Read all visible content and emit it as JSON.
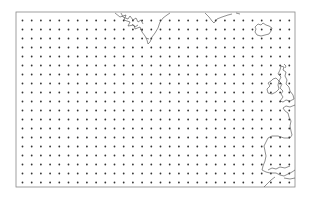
{
  "map": {
    "region": "North Atlantic",
    "frame": {
      "x": 16,
      "y": 12,
      "width": 279,
      "height": 175,
      "stroke": "#888888"
    },
    "grid": {
      "cols": 30,
      "rows": 19,
      "x0": 22.5,
      "y0": 20.5,
      "dx": 9.2,
      "dy": 9.0,
      "dot_color": "#333333",
      "dot_radius": 0.9
    },
    "coast_color": "#444444",
    "landmasses": [
      "Greenland",
      "Iceland",
      "Ireland",
      "Great Britain",
      "France",
      "Iberian Peninsula"
    ]
  }
}
